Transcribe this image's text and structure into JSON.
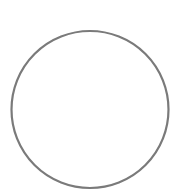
{
  "canvas": {
    "width": 184,
    "height": 196,
    "background": "#ffffff"
  },
  "shape": {
    "type": "circle-outline",
    "cx": 90,
    "cy": 109.5,
    "r": 78.5,
    "stroke": "#7a7a7a",
    "stroke_width": 2.2,
    "fill": "none"
  }
}
